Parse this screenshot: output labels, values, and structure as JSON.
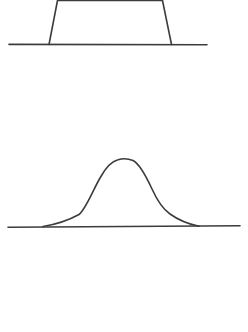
{
  "canvas": {
    "width": 248,
    "height": 332,
    "background": "#ffffff",
    "stroke_color": "#3c3c3c",
    "stroke_width": 1.6
  },
  "figures": {
    "top": {
      "label": "flat-top trapezoid pulse on a horizontal baseline, top edge cropped by the image border",
      "baseline_path": "M 9 44.4 L 207 44.8",
      "outline_path": "M 49 44.5 L 57.5 0.5 L 162.5 0.5 L 171.5 44.5"
    },
    "bottom": {
      "label": "bell-shaped gaussian pulse with flattened rounded top on a horizontal baseline",
      "baseline_path": "M 8 227.2 L 240 225.8",
      "outline_path": "M 43 226.5 C 55 224.5 70 219.5 79 214.5 C 86 209 93 190 100 178 C 106 167 111 161.5 118 159.8 C 122 158.5 128 158.5 133 160.5 C 139 163.5 146 176 152 189 C 157 200 162 208.5 170 214 C 177 219 188 224 199 226.3"
    }
  }
}
